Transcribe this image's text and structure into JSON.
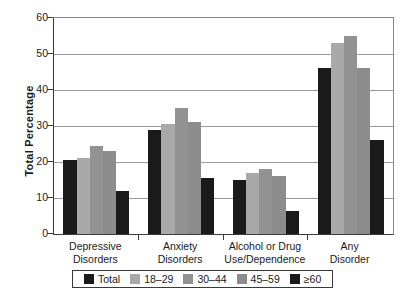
{
  "chart_data": {
    "type": "bar",
    "title": "",
    "xlabel": "",
    "ylabel": "Total Percentage",
    "ylim": [
      0,
      60
    ],
    "yticks": [
      0,
      10,
      20,
      30,
      40,
      50,
      60
    ],
    "grid": true,
    "legend_position": "bottom",
    "categories": [
      "Depressive Disorders",
      "Anxiety Disorders",
      "Alcohol or Drug Use/Dependence",
      "Any Disorder"
    ],
    "category_lines": [
      [
        "Depressive",
        "Disorders"
      ],
      [
        "Anxiety",
        "Disorders"
      ],
      [
        "Alcohol or Drug",
        "Use/Dependence"
      ],
      [
        "Any",
        "Disorder"
      ]
    ],
    "series": [
      {
        "name": "Total",
        "color": "#1a1a1a",
        "values": [
          20.5,
          29.0,
          15.0,
          46.0
        ]
      },
      {
        "name": "18–29",
        "color": "#a9a9a9",
        "values": [
          21.0,
          30.5,
          17.0,
          53.0
        ]
      },
      {
        "name": "30–44",
        "color": "#929292",
        "values": [
          24.5,
          35.0,
          18.0,
          55.0
        ]
      },
      {
        "name": "45–59",
        "color": "#8c8c8c",
        "values": [
          23.0,
          31.0,
          16.0,
          46.0
        ]
      },
      {
        "name": "≥60",
        "color": "#1a1a1a",
        "values": [
          12.0,
          15.5,
          6.5,
          26.0
        ]
      }
    ]
  },
  "axis": {
    "y_title": "Total Percentage",
    "y_tick_labels": [
      "60",
      "50",
      "40",
      "30",
      "20",
      "10",
      "0"
    ]
  },
  "legend": {
    "entries": [
      {
        "label": "Total",
        "color": "#1a1a1a"
      },
      {
        "label": "18–29",
        "color": "#a9a9a9"
      },
      {
        "label": "30–44",
        "color": "#929292"
      },
      {
        "label": "45–59",
        "color": "#8c8c8c"
      },
      {
        "label": "≥60",
        "color": "#1a1a1a"
      }
    ]
  }
}
